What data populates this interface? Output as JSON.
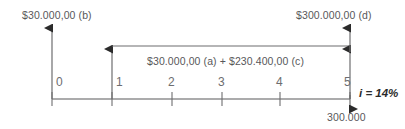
{
  "diagram": {
    "type": "cash-flow-timeline",
    "title": "",
    "background_color": "#ffffff",
    "line_color": "#6d6d6f",
    "axis_color": "#58585a",
    "text_color": "#58585a",
    "accent_text_color": "#2b2b2b",
    "axis": {
      "start_x": 52,
      "end_x": 350,
      "y": 99,
      "tick_labels": [
        "0",
        "1",
        "2",
        "3",
        "4",
        "5"
      ],
      "tick_x": [
        52,
        112,
        172,
        222,
        280,
        350
      ]
    },
    "labels": {
      "inflow_b": "$30.000,00 (b)",
      "inflow_d": "$300.000,00 (d)",
      "bracket_sum": "$30.000,00 (a) + $230.400,00 (c)",
      "outflow": "300.000",
      "rate": "i = 14%"
    },
    "arrows": [
      {
        "name": "inflow-arrow-period-0",
        "period": "0",
        "direction": "up",
        "value_label": "$30.000,00 (b)"
      },
      {
        "name": "inflow-arrow-period-1",
        "period": "1",
        "direction": "up",
        "value_label": "$30.000,00 (a) + $230.400,00 (c)"
      },
      {
        "name": "inflow-arrow-period-5-bracket",
        "period": "5",
        "direction": "up",
        "value_label": "$30.000,00 (a) + $230.400,00 (c)"
      },
      {
        "name": "inflow-arrow-period-5-top",
        "period": "5",
        "direction": "up",
        "value_label": "$300.000,00 (d)"
      },
      {
        "name": "outflow-arrow-period-5",
        "period": "5",
        "direction": "down",
        "value_label": "300.000"
      }
    ],
    "bracket": {
      "from_period": "1",
      "to_period": "5",
      "y": 46,
      "label": "$30.000,00 (a) + $230.400,00 (c)"
    }
  }
}
